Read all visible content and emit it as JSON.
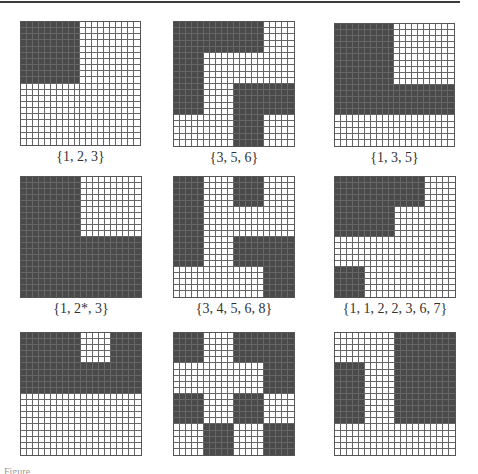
{
  "figure": {
    "grid_size": 20,
    "block_size": 5,
    "colors": {
      "dark": "#4a4a4a",
      "light": "#ffffff",
      "line": "#666666"
    },
    "panels": [
      {
        "label": "{1, 2, 3}",
        "x": 20,
        "y": 21,
        "w": 121,
        "h": 125,
        "dark_rects": [
          [
            0,
            0,
            10,
            10
          ]
        ]
      },
      {
        "label": "{3, 5, 6}",
        "x": 173,
        "y": 21,
        "w": 122,
        "h": 126,
        "dark_rects": [
          [
            0,
            0,
            5,
            15
          ],
          [
            5,
            0,
            10,
            5
          ],
          [
            10,
            10,
            5,
            10
          ],
          [
            15,
            10,
            5,
            5
          ]
        ]
      },
      {
        "label": "{1, 3, 5}",
        "x": 334,
        "y": 23,
        "w": 121,
        "h": 124,
        "dark_rects": [
          [
            0,
            0,
            10,
            15
          ],
          [
            10,
            10,
            10,
            5
          ]
        ]
      },
      {
        "label": "{1, 2*, 3}",
        "x": 20,
        "y": 176,
        "w": 122,
        "h": 122,
        "dark_rects": [
          [
            0,
            0,
            10,
            20
          ],
          [
            10,
            10,
            10,
            10
          ]
        ]
      },
      {
        "label": "{3, 4, 5, 6, 8}",
        "x": 173,
        "y": 176,
        "w": 122,
        "h": 122,
        "dark_rects": [
          [
            0,
            0,
            5,
            15
          ],
          [
            10,
            0,
            5,
            5
          ],
          [
            10,
            10,
            5,
            5
          ],
          [
            15,
            10,
            5,
            10
          ]
        ]
      },
      {
        "label": "{1, 1, 2, 2, 3, 6, 7}",
        "x": 334,
        "y": 176,
        "w": 122,
        "h": 122,
        "dark_rects": [
          [
            0,
            0,
            10,
            10
          ],
          [
            10,
            0,
            5,
            5
          ],
          [
            0,
            15,
            5,
            5
          ]
        ]
      },
      {
        "label": "",
        "x": 20,
        "y": 332,
        "w": 122,
        "h": 124,
        "dark_rects": [
          [
            0,
            0,
            10,
            10
          ],
          [
            15,
            0,
            5,
            10
          ],
          [
            10,
            5,
            5,
            5
          ]
        ]
      },
      {
        "label": "",
        "x": 173,
        "y": 332,
        "w": 122,
        "h": 124,
        "dark_rects": [
          [
            0,
            0,
            5,
            5
          ],
          [
            0,
            10,
            5,
            5
          ],
          [
            5,
            15,
            5,
            5
          ],
          [
            10,
            0,
            5,
            5
          ],
          [
            10,
            10,
            5,
            5
          ],
          [
            15,
            0,
            5,
            10
          ],
          [
            15,
            15,
            5,
            5
          ]
        ]
      },
      {
        "label": "",
        "x": 334,
        "y": 332,
        "w": 122,
        "h": 124,
        "dark_rects": [
          [
            0,
            5,
            5,
            10
          ],
          [
            10,
            0,
            10,
            15
          ]
        ]
      }
    ],
    "caption": "Figure"
  }
}
